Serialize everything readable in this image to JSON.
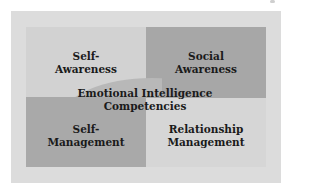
{
  "diagram": {
    "title": "Emotional Intelligence Competencies",
    "center_label_line1": "Emotional Intelligence",
    "center_label_line2": "Competencies",
    "quadrants": [
      {
        "position": "top-left",
        "line1": "Self-",
        "line2": "Awareness",
        "color": "#d2d2d2"
      },
      {
        "position": "top-right",
        "line1": "Social",
        "line2": "Awareness",
        "color": "#a7a7a7"
      },
      {
        "position": "bottom-left",
        "line1": "Self-",
        "line2": "Management",
        "color": "#a9a9a9"
      },
      {
        "position": "bottom-right",
        "line1": "Relationship",
        "line2": "Management",
        "color": "#d6d6d6"
      }
    ],
    "frame_color": "#dcdcdc"
  }
}
